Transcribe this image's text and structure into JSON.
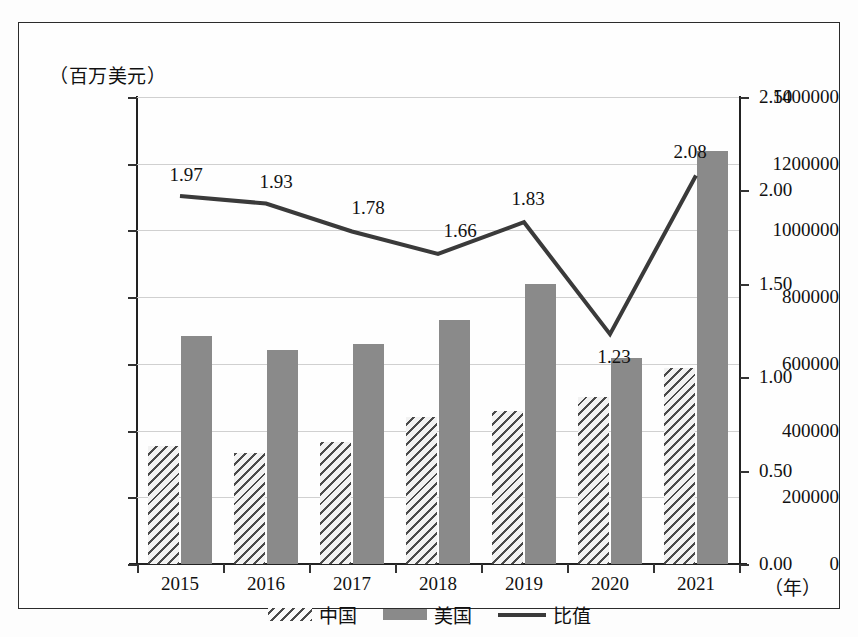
{
  "axis_unit_caption": "（百万美元）",
  "x_unit_label": "（年）",
  "chart_data": {
    "type": "bar",
    "title": "",
    "subtitle": "",
    "xlabel": "（年）",
    "ylabel": "（百万美元）",
    "y2label": "",
    "grid": true,
    "legend_position": "bottom",
    "categories": [
      "2015",
      "2016",
      "2017",
      "2018",
      "2019",
      "2020",
      "2021"
    ],
    "ylim": [
      0,
      1400000
    ],
    "yticks": [
      0,
      200000,
      400000,
      600000,
      800000,
      1000000,
      1200000,
      1400000
    ],
    "ytick_labels": [
      "0",
      "200000",
      "400000",
      "600000",
      "800000",
      "1000000",
      "1200000",
      "1400000"
    ],
    "y2lim": [
      0.0,
      2.5
    ],
    "y2ticks": [
      0.0,
      0.5,
      1.0,
      1.5,
      2.0,
      2.5
    ],
    "y2tick_labels": [
      "0.00",
      "0.50",
      "1.00",
      "1.50",
      "2.00",
      "2.50"
    ],
    "series": [
      {
        "name": "中国",
        "type": "bar",
        "axis": "left",
        "fill": "hatched",
        "values": [
          355000,
          333000,
          365000,
          440000,
          460000,
          500000,
          588000
        ]
      },
      {
        "name": "美国",
        "type": "bar",
        "axis": "left",
        "fill": "solid-gray",
        "values": [
          683000,
          643000,
          660000,
          733000,
          838000,
          617000,
          1238000
        ]
      },
      {
        "name": "比值",
        "type": "line",
        "axis": "right",
        "color": "#3a3a3a",
        "values": [
          1.97,
          1.93,
          1.78,
          1.66,
          1.83,
          1.23,
          2.08
        ],
        "data_labels": [
          "1.97",
          "1.93",
          "1.78",
          "1.66",
          "1.83",
          "1.23",
          "2.08"
        ]
      }
    ]
  },
  "legend": {
    "items": [
      {
        "label": "中国",
        "swatch": "hatched"
      },
      {
        "label": "美国",
        "swatch": "solid-gray"
      },
      {
        "label": "比值",
        "swatch": "line"
      }
    ]
  },
  "colors": {
    "bar_us": "#8a8a8a",
    "bar_cn_hatch": "#4a4a4a",
    "line": "#3a3a3a",
    "grid": "#d0d0d0",
    "axis": "#222222",
    "frame": "#2b2b2b"
  }
}
